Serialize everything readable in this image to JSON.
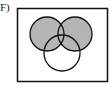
{
  "label": "F)",
  "diagram": {
    "type": "venn",
    "sets": [
      "A",
      "B",
      "C"
    ],
    "shaded_region": "A ∪ B",
    "colors": {
      "shade": "#b5b5b5",
      "stroke": "#111111",
      "background": "#ffffff"
    }
  }
}
